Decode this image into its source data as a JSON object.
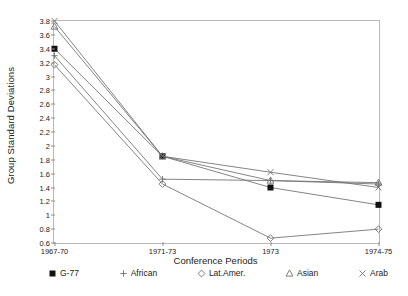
{
  "chart_data": {
    "type": "line",
    "title": "",
    "xlabel": "Conference Periods",
    "ylabel": "Group Standard Deviations",
    "categories": [
      "1967-70",
      "1971-73",
      "1973",
      "1974-75"
    ],
    "ylim": [
      0.6,
      3.8
    ],
    "yticks": [
      0.6,
      0.8,
      1,
      1.2,
      1.4,
      1.6,
      1.8,
      2,
      2.2,
      2.4,
      2.6,
      2.8,
      3,
      3.2,
      3.4,
      3.6,
      3.8
    ],
    "ytick_labels": [
      "0.6",
      "0.8",
      "1",
      "1.2",
      "1.4",
      "1.6",
      "1.8",
      "2",
      "2.2",
      "2.4",
      "2.6",
      "2.8",
      "3",
      "3.2",
      "3.4",
      "3.6",
      "3.8"
    ],
    "grid": false,
    "legend_position": "bottom",
    "series": [
      {
        "name": "G-77",
        "marker": "filled-square",
        "color": "#111111",
        "values": [
          3.4,
          1.85,
          1.4,
          1.15
        ]
      },
      {
        "name": "African",
        "marker": "plus",
        "color": "#555555",
        "values": [
          3.3,
          1.52,
          1.5,
          1.45
        ]
      },
      {
        "name": "Lat.Amer.",
        "marker": "diamond",
        "color": "#555555",
        "values": [
          3.17,
          1.45,
          0.67,
          0.8
        ]
      },
      {
        "name": "Asian",
        "marker": "triangle",
        "color": "#555555",
        "values": [
          3.72,
          1.85,
          1.5,
          1.47
        ]
      },
      {
        "name": "Arab",
        "marker": "cross",
        "color": "#555555",
        "values": [
          3.8,
          1.85,
          1.62,
          1.4
        ]
      }
    ]
  },
  "legend": {
    "items": [
      {
        "label": "G-77",
        "marker": "filled-square"
      },
      {
        "label": "African",
        "marker": "plus"
      },
      {
        "label": "Lat.Amer.",
        "marker": "diamond"
      },
      {
        "label": "Asian",
        "marker": "triangle"
      },
      {
        "label": "Arab",
        "marker": "cross"
      }
    ]
  }
}
